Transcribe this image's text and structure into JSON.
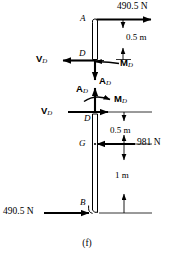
{
  "figure": {
    "caption": "(f)",
    "background_color": "#ffffff",
    "line_color": "#000000",
    "width": 174,
    "height": 260
  },
  "upper_body": {
    "point_a_label": "A",
    "point_d_label": "D",
    "applied_force": "490.5 N",
    "dimension_ad": "0.5 m",
    "shear_label": "V",
    "shear_sub": "D",
    "moment_label": "M",
    "moment_sub": "D",
    "axial_label": "A",
    "axial_sub": "D"
  },
  "lower_body": {
    "point_d_label": "D",
    "point_g_label": "G",
    "point_b_label": "B",
    "weight_force": "981 N",
    "applied_force": "490.5 N",
    "dimension_dg": "0.5 m",
    "dimension_gb": "1 m",
    "shear_label": "V",
    "shear_sub": "D",
    "moment_label": "M",
    "moment_sub": "D",
    "axial_label": "A",
    "axial_sub": "D"
  }
}
